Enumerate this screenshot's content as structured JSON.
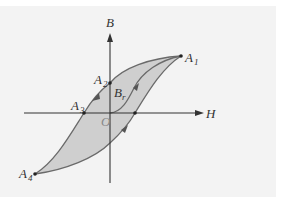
{
  "diagram": {
    "colors": {
      "background": "#f3f3f3",
      "loop_fill": "#cfcfcf",
      "curve_stroke": "#6a6a6a",
      "axis_stroke": "#333333"
    },
    "axes": {
      "x_label": "H",
      "y_label": "B",
      "origin_label": "O"
    },
    "points": {
      "A1": {
        "main": "A",
        "sub": "1"
      },
      "A2": {
        "main": "A",
        "sub": "2"
      },
      "A3": {
        "main": "A",
        "sub": "3"
      },
      "A4": {
        "main": "A",
        "sub": "4"
      },
      "Br": {
        "main": "B",
        "sub": "r"
      }
    },
    "curves": [
      {
        "name": "initial-magnetization",
        "from": "O",
        "to": "A1",
        "direction": "up"
      },
      {
        "name": "upper-branch",
        "from": "A1",
        "to": "A4",
        "via": [
          "A2",
          "A3"
        ],
        "direction": "down"
      },
      {
        "name": "lower-branch",
        "from": "A4",
        "to": "A1",
        "direction": "up"
      }
    ]
  }
}
